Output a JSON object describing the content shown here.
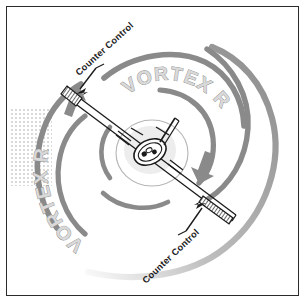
{
  "figure": {
    "background_color": "#ffffff",
    "border_color": "#2b2b2b"
  },
  "labels": {
    "vortex_roll_top": "VORTEX ROLL",
    "vortex_roll_left": "VORTEX ROLL",
    "counter_control_top": "Counter Control",
    "counter_control_bottom": "Counter Control"
  },
  "colors": {
    "vortex_gray": "#8a8a8a",
    "vortex_gray_light": "#a8a8a8",
    "vortex_text_fill": "#d9d9d9",
    "vortex_text_stroke": "#8f8f8f",
    "label_text": "#1b1b1b",
    "aircraft_outline": "#1b1b1b",
    "aircraft_fill": "#ffffff",
    "aileron_hatch": "#2b2b2b",
    "halo_fill": "#efefef",
    "speckle": "#c9c9c9"
  },
  "elements": {
    "aircraft": "aircraft-front-view",
    "wing_span_angle_deg": -28,
    "vortex_rotation": "clockwise-from-left-upward",
    "arrow_left": "vortex-arrow-up-left",
    "arrow_right": "vortex-arrow-down-right",
    "aileron_left": "left-wingtip-aileron",
    "aileron_right": "right-wingtip-aileron",
    "spiral_arm_count": 4
  }
}
